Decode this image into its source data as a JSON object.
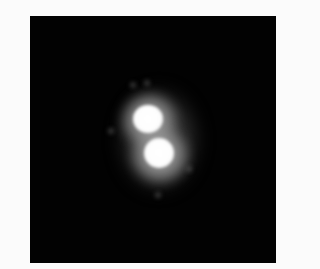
{
  "image": {
    "description": "Grayscale micrograph showing two adjacent bright fluorescent blobs on a black background",
    "background_color": "#020202",
    "border_color": "#fbfbfb",
    "objects": [
      {
        "name": "upper-blob",
        "center": [
          147,
          118
        ],
        "core_radius": 14
      },
      {
        "name": "lower-blob",
        "center": [
          158,
          152
        ],
        "core_radius": 15
      }
    ]
  }
}
